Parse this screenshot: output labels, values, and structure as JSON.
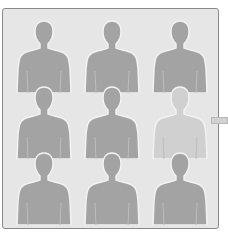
{
  "grid": {
    "rows": 3,
    "columns": 3,
    "figures": [
      {
        "name": "silhouette-1",
        "color": "#a3a3a3"
      },
      {
        "name": "silhouette-2",
        "color": "#a3a3a3"
      },
      {
        "name": "silhouette-3",
        "color": "#a3a3a3"
      },
      {
        "name": "silhouette-4",
        "color": "#a3a3a3"
      },
      {
        "name": "silhouette-5",
        "color": "#a3a3a3"
      },
      {
        "name": "silhouette-6",
        "color": "#d0d0d0"
      },
      {
        "name": "silhouette-7",
        "color": "#a3a3a3"
      },
      {
        "name": "silhouette-8",
        "color": "#a3a3a3"
      },
      {
        "name": "silhouette-9",
        "color": "#a3a3a3"
      }
    ]
  },
  "colors": {
    "panel": "#e6e6e6",
    "border": "#8a8a8a",
    "figure": "#a3a3a3",
    "figure_highlight": "#d0d0d0"
  }
}
